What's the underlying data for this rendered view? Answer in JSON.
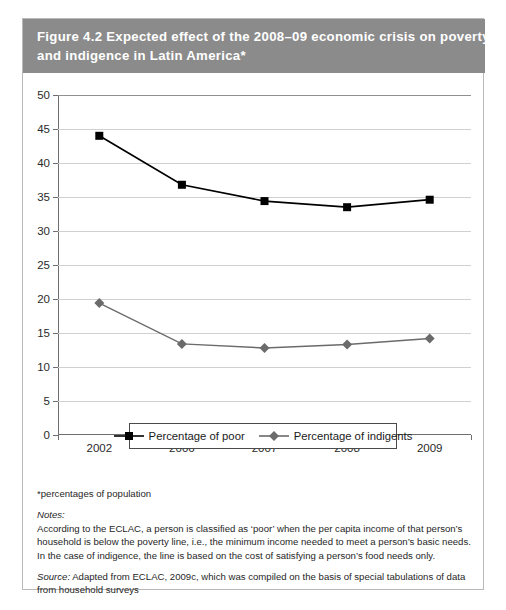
{
  "figure": {
    "label": "Figure 4.2",
    "title_line1": "Expected effect of the 2008–09 economic crisis on poverty",
    "title_line2": "and indigence in Latin America*",
    "header_bg": "#8b8b8b",
    "header_text_color": "#ffffff"
  },
  "chart_data": {
    "type": "line",
    "title": "Expected effect of the 2008–09 economic crisis on poverty and indigence in Latin America*",
    "xlabel": "",
    "ylabel": "",
    "categories": [
      "2002",
      "2006",
      "2007",
      "2008",
      "2009"
    ],
    "ylim": [
      0,
      50
    ],
    "yticks": [
      0,
      5,
      10,
      15,
      20,
      25,
      30,
      35,
      40,
      45,
      50
    ],
    "ytick_labels": [
      "0",
      "5",
      "10",
      "15",
      "20",
      "25",
      "30",
      "35",
      "40",
      "45",
      "50"
    ],
    "grid": true,
    "legend_position": "bottom",
    "series": [
      {
        "name": "Percentage of poor",
        "values": [
          44.0,
          36.8,
          34.4,
          33.5,
          34.6
        ],
        "color": "#000000",
        "marker": "square"
      },
      {
        "name": "Percentage of indigents",
        "values": [
          19.4,
          13.4,
          12.8,
          13.3,
          14.2
        ],
        "color": "#6b6b6b",
        "marker": "diamond"
      }
    ]
  },
  "legend": {
    "items": [
      {
        "label": "Percentage of poor",
        "marker": "square",
        "color": "#000000"
      },
      {
        "label": "Percentage of indigents",
        "marker": "diamond",
        "color": "#6b6b6b"
      }
    ]
  },
  "notes": {
    "asterisk": "*percentages of population",
    "notes_label": "Notes:",
    "note_line1": "According to the ECLAC, a person is classified as ‘poor’ when the per capita income of that person’s",
    "note_line2": "household is below the poverty line, i.e., the minimum income needed to meet a person’s basic needs.",
    "note_line3": "In the case of indigence, the line is based on the cost of satisfying a person’s food needs only.",
    "source_label": "Source:",
    "source_text": " Adapted from ECLAC, 2009c, which was compiled on the basis of special tabulations of data from household surveys"
  }
}
